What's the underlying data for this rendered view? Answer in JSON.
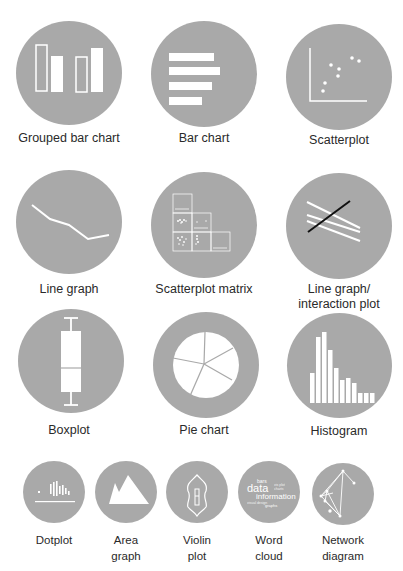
{
  "figure": {
    "circle_color": "#a9a9a9",
    "glyph_color": "#ffffff",
    "background_color": "#ffffff",
    "text_color": "#2a2a2a"
  },
  "items": [
    {
      "id": "grouped-bar-chart",
      "label": "Grouped bar chart"
    },
    {
      "id": "bar-chart",
      "label": "Bar chart"
    },
    {
      "id": "scatterplot",
      "label": "Scatterplot"
    },
    {
      "id": "line-graph",
      "label": "Line graph"
    },
    {
      "id": "scatterplot-matrix",
      "label": "Scatterplot matrix"
    },
    {
      "id": "interaction-plot",
      "label_line1": "Line graph/",
      "label_line2": "interaction plot"
    },
    {
      "id": "boxplot",
      "label": "Boxplot"
    },
    {
      "id": "pie-chart",
      "label": "Pie chart"
    },
    {
      "id": "histogram",
      "label": "Histogram"
    },
    {
      "id": "dotplot",
      "label": "Dotplot"
    },
    {
      "id": "area-graph",
      "label_line1": "Area",
      "label_line2": "graph"
    },
    {
      "id": "violin-plot",
      "label_line1": "Violin",
      "label_line2": "plot"
    },
    {
      "id": "word-cloud",
      "label_line1": "Word",
      "label_line2": "cloud",
      "words": [
        "bars",
        "data",
        "information",
        "graphs"
      ]
    },
    {
      "id": "network-diagram",
      "label_line1": "Network",
      "label_line2": "diagram"
    }
  ]
}
